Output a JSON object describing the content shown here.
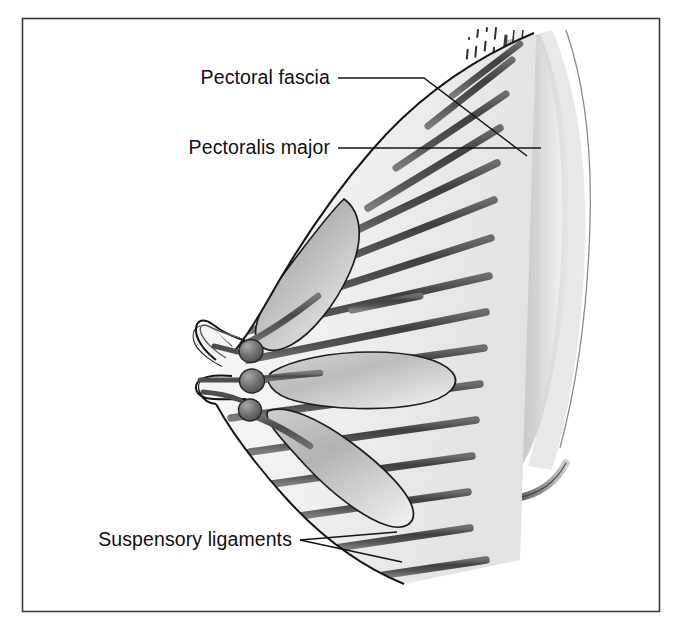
{
  "figure": {
    "type": "anatomical-illustration",
    "frame": {
      "border_color": "#3a3a3a",
      "background_color": "#ffffff",
      "x": 22,
      "y": 18,
      "width": 638,
      "height": 594
    },
    "palette": {
      "outline": "#1a1a1a",
      "breast_fill_light": "#f2f2f2",
      "breast_fill_mid": "#e3e3e3",
      "lobule_fill_light": "#e8e8e8",
      "lobule_fill_dark": "#a9a9a9",
      "ligament_dark": "#4e4e4e",
      "ligament_mid": "#6b6b6b",
      "muscle_light": "#ededed",
      "muscle_mid": "#b4b4b4",
      "muscle_dark": "#8e8e8e",
      "fascia_dash": "#2f2f2f",
      "leader_line": "#141414"
    }
  },
  "labels": [
    {
      "id": "pectoral-fascia",
      "text": "Pectoral fascia",
      "text_x": 330,
      "text_y": 84,
      "anchor": "end",
      "leaders": [
        {
          "points": "338,78 424,78 527,156"
        }
      ]
    },
    {
      "id": "pectoralis-major",
      "text": "Pectoralis major",
      "text_x": 330,
      "text_y": 154,
      "anchor": "end",
      "leaders": [
        {
          "points": "338,148 541,148"
        }
      ]
    },
    {
      "id": "suspensory-ligaments",
      "text": "Suspensory ligaments",
      "text_x": 292,
      "text_y": 546,
      "anchor": "end",
      "leaders": [
        {
          "points": "300,540 397,532"
        },
        {
          "points": "300,540 400,561"
        }
      ]
    }
  ],
  "structures": {
    "breast_outline_name": "breast-tissue-outline",
    "nipple_name": "nipple",
    "lactiferous_sinuses": 3,
    "lobules": 3,
    "suspensory_ligament_strands": 17,
    "chest_wall_layers": [
      "pectoral-fascia-dashed-band",
      "deep-fascia-line",
      "pectoralis-major-muscle",
      "rib-cage-curve"
    ]
  }
}
